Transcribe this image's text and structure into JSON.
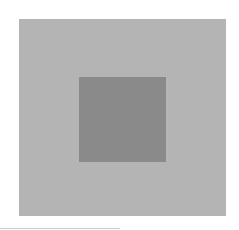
{
  "figure": {
    "background_color": "#ffffff",
    "outer_square": {
      "color": "#b4b4b4",
      "x": 19,
      "y": 19,
      "width": 207,
      "height": 197
    },
    "inner_square": {
      "color": "#8a8a8a",
      "x": 79,
      "y": 77,
      "width": 87,
      "height": 85
    }
  }
}
